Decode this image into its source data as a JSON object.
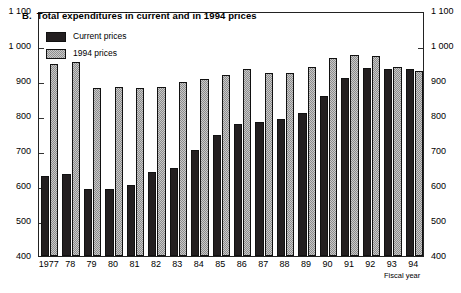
{
  "chart_data": {
    "type": "bar",
    "title": "Total expenditures in current and in 1994 prices",
    "panel_letter": "B.",
    "xlabel": "Fiscal year",
    "ylabel": "",
    "ylim": [
      400,
      1100
    ],
    "ytick_step": 100,
    "grid": false,
    "legend_position": "top-left-inside",
    "categories": [
      "1977",
      "78",
      "79",
      "80",
      "81",
      "82",
      "83",
      "84",
      "85",
      "86",
      "87",
      "88",
      "89",
      "90",
      "91",
      "92",
      "93",
      "94"
    ],
    "ytick_labels_left": [
      "1 100",
      "1 000",
      "900",
      "800",
      "700",
      "600",
      "500",
      "400"
    ],
    "ytick_labels_right": [
      "1 100",
      "1 000",
      "900",
      "800",
      "700",
      "600",
      "500",
      "400"
    ],
    "ytick_values": [
      1100,
      1000,
      900,
      800,
      700,
      600,
      500,
      400
    ],
    "series": [
      {
        "name": "Current prices",
        "color": "#231f20",
        "values": [
          628,
          634,
          592,
          592,
          604,
          641,
          652,
          703,
          747,
          778,
          783,
          792,
          810,
          858,
          908,
          938,
          935,
          934
        ]
      },
      {
        "name": "1994 prices",
        "color": "#c9c9c9",
        "values": [
          950,
          955,
          879,
          883,
          879,
          882,
          898,
          905,
          918,
          935,
          924,
          922,
          941,
          966,
          974,
          972,
          941,
          930
        ]
      }
    ]
  },
  "axis": {
    "left_labels": [
      "1 100",
      "1 000",
      "900",
      "800",
      "700",
      "600",
      "500",
      "400"
    ],
    "right_labels": [
      "1 100",
      "1 000",
      "900",
      "800",
      "700",
      "600",
      "500",
      "400"
    ],
    "x_labels": [
      "1977",
      "78",
      "79",
      "80",
      "81",
      "82",
      "83",
      "84",
      "85",
      "86",
      "87",
      "88",
      "89",
      "90",
      "91",
      "92",
      "93",
      "94"
    ],
    "x_title": "Fiscal year"
  },
  "title": {
    "letter": "B.",
    "text": "Total expenditures in current and in 1994 prices"
  },
  "legend": {
    "items": [
      {
        "label": "Current prices",
        "swatch": "current"
      },
      {
        "label": "1994 prices",
        "swatch": "constant"
      }
    ]
  }
}
